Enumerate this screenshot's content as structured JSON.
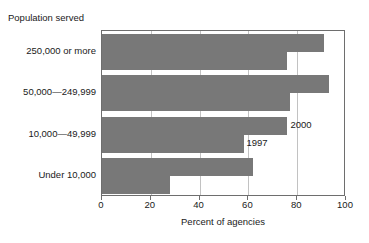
{
  "chart_data": {
    "type": "bar",
    "orientation": "horizontal",
    "title": "Population served",
    "xlabel": "Percent of agencies",
    "ylabel": "Population served",
    "categories": [
      "250,000 or more",
      "50,000—249,999",
      "10,000—49,999",
      "Under 10,000"
    ],
    "series": [
      {
        "name": "2000",
        "values": [
          91,
          93,
          76,
          62
        ]
      },
      {
        "name": "1997",
        "values": [
          76,
          77,
          58,
          28
        ]
      }
    ],
    "xlim": [
      0,
      100
    ],
    "xticks": [
      0,
      20,
      40,
      60,
      80,
      100
    ],
    "xtick_labels": [
      "0",
      "20",
      "40",
      "60",
      "80",
      "100"
    ],
    "grid": "vertical",
    "legend_position": "inline-annotation",
    "annotations": [
      {
        "text": "2000",
        "value_ref": "10,000—49,999 / 2000"
      },
      {
        "text": "1997",
        "value_ref": "10,000—49,999 / 1997"
      }
    ],
    "colors": {
      "bar": "#787878",
      "gridline": "#c2c2c2",
      "axis": "#6e6e6e",
      "background": "#ffffff",
      "text": "#1a1a1a"
    }
  }
}
